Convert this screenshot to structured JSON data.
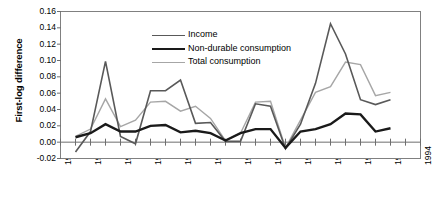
{
  "chart_data": {
    "type": "line",
    "title": "",
    "xlabel": "",
    "ylabel": "First-log difference",
    "xlim": [
      1970,
      1994
    ],
    "ylim": [
      -0.02,
      0.16
    ],
    "grid": false,
    "legend_position": "upper-center-left",
    "y_ticks": [
      "0.16",
      "0.14",
      "0.12",
      "0.10",
      "0.08",
      "0.06",
      "0.04",
      "0.02",
      "0.00",
      "-0.02"
    ],
    "y_tick_values": [
      0.16,
      0.14,
      0.12,
      0.1,
      0.08,
      0.06,
      0.04,
      0.02,
      0.0,
      -0.02
    ],
    "x_ticks": [
      "1970",
      "1972",
      "1974",
      "1976",
      "1978",
      "1980",
      "1982",
      "1984",
      "1986",
      "1988",
      "1990",
      "1992",
      "1994"
    ],
    "x_tick_values": [
      1970,
      1972,
      1974,
      1976,
      1978,
      1980,
      1982,
      1984,
      1986,
      1988,
      1990,
      1992,
      1994
    ],
    "x": [
      1971,
      1972,
      1973,
      1974,
      1975,
      1976,
      1977,
      1978,
      1979,
      1980,
      1981,
      1982,
      1983,
      1984,
      1985,
      1986,
      1987,
      1988,
      1989,
      1990,
      1991,
      1992
    ],
    "series": [
      {
        "name": "Income",
        "color": "#595959",
        "width": 1.6,
        "values": [
          -0.012,
          0.013,
          0.099,
          0.007,
          -0.002,
          0.063,
          0.063,
          0.076,
          0.023,
          0.024,
          0.001,
          0.001,
          0.047,
          0.044,
          -0.008,
          0.022,
          0.072,
          0.145,
          0.108,
          0.052,
          0.046,
          0.052
        ]
      },
      {
        "name": "Non-durable consumption",
        "color": "#1a1a1a",
        "width": 2.4,
        "values": [
          0.006,
          0.011,
          0.022,
          0.013,
          0.013,
          0.02,
          0.021,
          0.012,
          0.014,
          0.011,
          0.002,
          0.011,
          0.016,
          0.016,
          -0.007,
          0.013,
          0.016,
          0.022,
          0.035,
          0.034,
          0.013,
          0.017
        ]
      },
      {
        "name": "Total consumption",
        "color": "#a6a6a6",
        "width": 1.4,
        "values": [
          0.007,
          0.016,
          0.053,
          0.019,
          0.027,
          0.049,
          0.05,
          0.038,
          0.044,
          0.029,
          0.002,
          0.011,
          0.049,
          0.05,
          -0.007,
          0.027,
          0.061,
          0.068,
          0.098,
          0.095,
          0.057,
          0.061
        ]
      }
    ]
  },
  "legend": {
    "items": [
      {
        "label": "Income"
      },
      {
        "label": "Non-durable consumption"
      },
      {
        "label": "Total consumption"
      }
    ]
  },
  "axes": {
    "y_title": "First-log difference"
  }
}
